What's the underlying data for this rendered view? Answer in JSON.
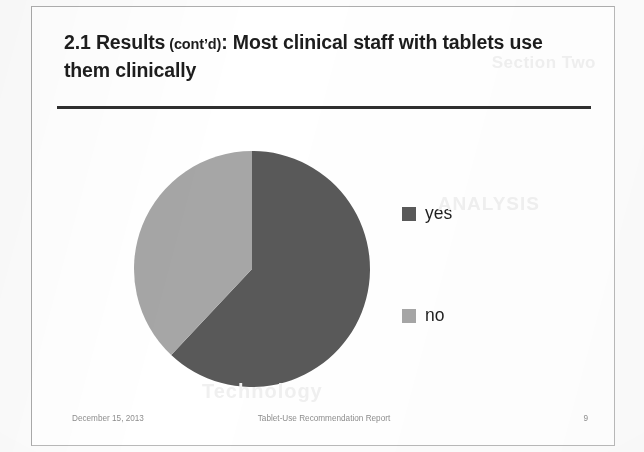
{
  "slide": {
    "title_main_1": "2.1 Results",
    "title_paren": " (cont’d)",
    "title_main_2": ": Most clinical staff with tablets use them clinically",
    "title_full": "2.1 Results (cont’d): Most clinical staff with tablets use them clinically"
  },
  "footer": {
    "date": "December 15, 2013",
    "document_title": "Tablet-Use Recommendation Report",
    "page_number": "9"
  },
  "colors": {
    "yes_slice": "#595959",
    "no_slice": "#a6a6a6",
    "title_text": "#1d1d1d",
    "rule": "#2f2f2f",
    "frame_border": "#b9b9b9",
    "footer_text": "#8e8e8e",
    "slide_background": "#ffffff",
    "page_background": "#fcfcfc"
  },
  "ghost_text": {
    "top_right": "Section Two",
    "mid_right": "ANALYSIS",
    "bottom": "Technology"
  },
  "chart_data": {
    "type": "pie",
    "title": "",
    "categories": [
      "yes",
      "no"
    ],
    "values": [
      62,
      38
    ],
    "value_unit": "percent",
    "colors": [
      "#595959",
      "#a6a6a6"
    ],
    "legend": [
      "yes",
      "no"
    ],
    "legend_position": "right",
    "start_angle_deg": 0,
    "direction": "clockwise",
    "grid": false,
    "data_labels": false,
    "xlabel": "",
    "ylabel": ""
  }
}
